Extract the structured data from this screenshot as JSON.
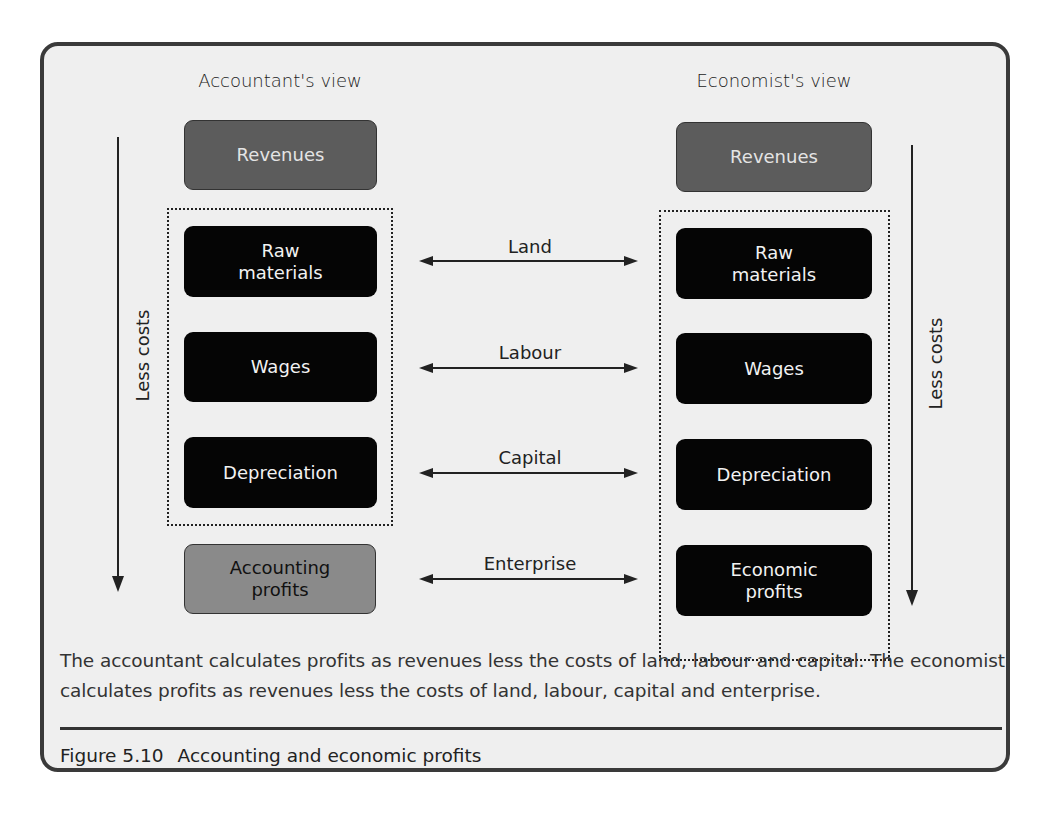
{
  "figure": {
    "number": "Figure 5.10",
    "title": "Accounting and economic profits",
    "caption": "The accountant calculates profits as revenues less the costs of land, labour and capital. The economist calculates profits as revenues less the costs of land, labour, capital and enterprise."
  },
  "left": {
    "title": "Accountant's view",
    "arrow_label": "Less costs",
    "boxes": [
      {
        "label": "Revenues",
        "style": "revenue"
      },
      {
        "label": "Raw\nmaterials",
        "style": "cost"
      },
      {
        "label": "Wages",
        "style": "cost"
      },
      {
        "label": "Depreciation",
        "style": "cost"
      },
      {
        "label": "Accounting\nprofits",
        "style": "profit-light"
      }
    ]
  },
  "right": {
    "title": "Economist's view",
    "arrow_label": "Less costs",
    "boxes": [
      {
        "label": "Revenues",
        "style": "revenue"
      },
      {
        "label": "Raw\nmaterials",
        "style": "cost"
      },
      {
        "label": "Wages",
        "style": "cost"
      },
      {
        "label": "Depreciation",
        "style": "cost"
      },
      {
        "label": "Economic\nprofits",
        "style": "cost"
      }
    ]
  },
  "connectors": [
    {
      "label": "Land"
    },
    {
      "label": "Labour"
    },
    {
      "label": "Capital"
    },
    {
      "label": "Enterprise"
    }
  ],
  "colors": {
    "revenue_box": "#5c5c5c",
    "cost_box": "#050505",
    "accounting_profit_box": "#8a8a8a",
    "frame_bg": "#efefef",
    "frame_border": "#3a3a3a"
  }
}
